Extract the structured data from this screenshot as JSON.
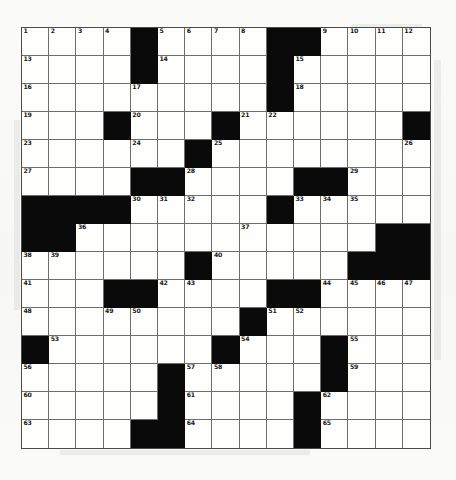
{
  "puzzle": {
    "kind": "crossword-grid",
    "title": "",
    "rows": 15,
    "cols": 15,
    "cell_size_px": 27,
    "colors": {
      "block": "#0a0a0a",
      "open": "#fefefd",
      "gridline": "#6e6e6e",
      "border": "#4a4a4a",
      "number_text": "#18181a",
      "page_background": "#fbfbfa"
    },
    "highest_clue_number": 65,
    "legend": {
      "block_label": "blocked square",
      "open_label": "open square"
    },
    "grid": [
      [
        "1",
        "2",
        "3",
        "4",
        "#",
        "5",
        "6",
        "7",
        "8",
        "#",
        "#",
        "9",
        "10",
        "11",
        "12"
      ],
      [
        "13",
        "",
        "",
        "",
        "#",
        "14",
        "",
        "",
        "",
        "#",
        "15",
        "",
        "",
        "",
        ""
      ],
      [
        "16",
        "",
        "",
        "",
        "17",
        "",
        "",
        "",
        "",
        "#",
        "18",
        "",
        "",
        "",
        ""
      ],
      [
        "19",
        "",
        "",
        "#",
        "20",
        "",
        "",
        "#",
        "21",
        "22",
        "",
        "",
        "",
        "",
        "#"
      ],
      [
        "23",
        "",
        "",
        "",
        "24",
        "",
        "#",
        "25",
        "",
        "",
        "",
        "",
        "",
        "",
        "26"
      ],
      [
        "27",
        "",
        "",
        "",
        "#",
        "#",
        "28",
        "",
        "",
        "",
        "#",
        "#",
        "29",
        "",
        ""
      ],
      [
        "#",
        "#",
        "#",
        "#",
        "30",
        "31",
        "32",
        "",
        "",
        "#",
        "33",
        "34",
        "35",
        "",
        ""
      ],
      [
        "#",
        "#",
        "36",
        "",
        "",
        "",
        "",
        "",
        "37",
        "",
        "",
        "",
        "",
        "#",
        "#"
      ],
      [
        "38",
        "39",
        "",
        "",
        "",
        "",
        "#",
        "40",
        "",
        "",
        "",
        "",
        "#",
        "#",
        "#"
      ],
      [
        "41",
        "",
        "",
        "#",
        "#",
        "42",
        "43",
        "",
        "",
        "#",
        "#",
        "44",
        "45",
        "46",
        "47"
      ],
      [
        "48",
        "",
        "",
        "49",
        "50",
        "",
        "",
        "",
        "#",
        "51",
        "52",
        "",
        "",
        "",
        ""
      ],
      [
        "#",
        "53",
        "",
        "",
        "",
        "",
        "",
        "#",
        "54",
        "",
        "",
        "#",
        "55",
        "",
        ""
      ],
      [
        "56",
        "",
        "",
        "",
        "",
        "#",
        "57",
        "58",
        "",
        "",
        "",
        "#",
        "59",
        "",
        ""
      ],
      [
        "60",
        "",
        "",
        "",
        "",
        "#",
        "61",
        "",
        "",
        "",
        "#",
        "62",
        "",
        "",
        ""
      ],
      [
        "63",
        "",
        "",
        "",
        "#",
        "#",
        "64",
        "",
        "",
        "",
        "#",
        "65",
        "",
        "",
        ""
      ]
    ],
    "rows_detail": [
      {
        "row": 1,
        "blocks": [
          5,
          10,
          11
        ],
        "numbers": {
          "1": "1",
          "2": "2",
          "3": "3",
          "4": "4",
          "6": "5",
          "7": "6",
          "8": "7",
          "9": "8",
          "12": "9",
          "13": "10",
          "14": "11",
          "15": "12"
        }
      },
      {
        "row": 2,
        "blocks": [
          5,
          10
        ],
        "numbers": {
          "1": "13",
          "6": "14",
          "11": "15"
        }
      },
      {
        "row": 3,
        "blocks": [
          10
        ],
        "numbers": {
          "1": "16",
          "5": "17",
          "11": "18"
        }
      },
      {
        "row": 4,
        "blocks": [
          4,
          8,
          15
        ],
        "numbers": {
          "1": "19",
          "5": "20",
          "9": "21",
          "10": "22"
        }
      },
      {
        "row": 5,
        "blocks": [
          7
        ],
        "numbers": {
          "1": "23",
          "5": "24",
          "8": "25",
          "15": "26"
        }
      },
      {
        "row": 6,
        "blocks": [
          5,
          6,
          11,
          12
        ],
        "numbers": {
          "1": "27",
          "7": "28",
          "13": "29"
        }
      },
      {
        "row": 7,
        "blocks": [
          1,
          2,
          3,
          4,
          10
        ],
        "numbers": {
          "5": "30",
          "6": "31",
          "7": "32",
          "11": "33",
          "12": "34",
          "13": "35"
        }
      },
      {
        "row": 8,
        "blocks": [
          1,
          2,
          14,
          15
        ],
        "numbers": {
          "3": "36",
          "9": "37"
        }
      },
      {
        "row": 9,
        "blocks": [
          7,
          13,
          14,
          15
        ],
        "numbers": {
          "1": "38",
          "2": "39",
          "8": "40"
        }
      },
      {
        "row": 10,
        "blocks": [
          4,
          5,
          10,
          11
        ],
        "numbers": {
          "1": "41",
          "6": "42",
          "7": "43",
          "12": "44",
          "13": "45",
          "14": "46",
          "15": "47"
        }
      },
      {
        "row": 11,
        "blocks": [
          9
        ],
        "numbers": {
          "1": "48",
          "4": "49",
          "5": "50",
          "10": "51",
          "11": "52"
        }
      },
      {
        "row": 12,
        "blocks": [
          1,
          8,
          12
        ],
        "numbers": {
          "2": "53",
          "9": "54",
          "13": "55"
        }
      },
      {
        "row": 13,
        "blocks": [
          6,
          12
        ],
        "numbers": {
          "1": "56",
          "7": "57",
          "8": "58",
          "13": "59"
        }
      },
      {
        "row": 14,
        "blocks": [
          6,
          11
        ],
        "numbers": {
          "1": "60",
          "7": "61",
          "12": "62"
        }
      },
      {
        "row": 15,
        "blocks": [
          5,
          6,
          11
        ],
        "numbers": {
          "1": "63",
          "7": "64",
          "12": "65"
        }
      }
    ]
  }
}
